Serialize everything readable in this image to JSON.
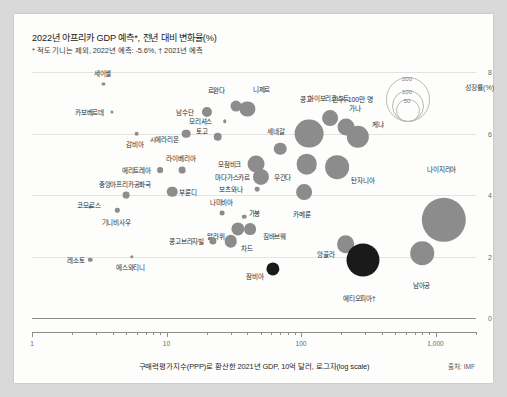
{
  "header": {
    "title": "2022년 아프리카 GDP 예측*, 전년 대비 변화율(%)",
    "subtitle": "* 적도 기니는 제외, 2022년 예측: -5.6%, † 2021년 예측"
  },
  "legend": {
    "name": "인구, 100만 명",
    "sizes": [
      "200",
      "100",
      "50"
    ]
  },
  "footer": {
    "source": "출처: IMF"
  },
  "axes": {
    "y_label": "성장률(%)",
    "y_ticks": [
      "8",
      "6",
      "4",
      "2",
      "0"
    ],
    "x_title": "구매력평가지수(PPP)로 환산한 2021년 GDP, 10억 달러, 로그자(log scale)",
    "x_ticks": [
      "1",
      "10",
      "100",
      "1,000"
    ]
  },
  "chart_data": {
    "type": "scatter",
    "title": "2022년 아프리카 GDP 예측*, 전년 대비 변화율(%)",
    "xlabel": "구매력평가지수(PPP)로 환산한 2021년 GDP, 10억 달러, 로그자(log scale)",
    "ylabel": "성장률(%)",
    "xscale": "log",
    "xlim": [
      1,
      2000
    ],
    "ylim": [
      0,
      8
    ],
    "grid": true,
    "legend_position": "top-right",
    "size_encodes": "인구, 100만 명",
    "points": [
      {
        "label": "세이셸",
        "x": 3.4,
        "y": 7.6,
        "pop": 0.1,
        "color": "#8c8c8c",
        "lx": -1,
        "ly": -10
      },
      {
        "label": "카보베르데",
        "x": 3.9,
        "y": 6.7,
        "pop": 0.6,
        "color": "#8c8c8c",
        "lx": -22,
        "ly": 0
      },
      {
        "label": "남수단",
        "x": 20,
        "y": 6.7,
        "pop": 11,
        "color": "#8c8c8c",
        "lx": -22,
        "ly": 0
      },
      {
        "label": "르완다",
        "x": 33,
        "y": 6.9,
        "pop": 13,
        "color": "#8c8c8c",
        "lx": -20,
        "ly": -10
      },
      {
        "label": "니제르",
        "x": 40,
        "y": 6.8,
        "pop": 25,
        "color": "#8c8c8c",
        "lx": 14,
        "ly": -12
      },
      {
        "label": "모리셔스",
        "x": 27,
        "y": 6.4,
        "pop": 1.3,
        "color": "#8c8c8c",
        "lx": -24,
        "ly": 0
      },
      {
        "label": "아이보리코스트",
        "x": 165,
        "y": 6.5,
        "pop": 27,
        "color": "#8c8c8c",
        "lx": -2,
        "ly": -12
      },
      {
        "label": "가나",
        "x": 215,
        "y": 6.2,
        "pop": 31,
        "color": "#8c8c8c",
        "lx": 9,
        "ly": -11
      },
      {
        "label": "감비아",
        "x": 6.0,
        "y": 6.0,
        "pop": 2.4,
        "color": "#8c8c8c",
        "lx": -2,
        "ly": 8
      },
      {
        "label": "시에라리온",
        "x": 14,
        "y": 6.0,
        "pop": 8,
        "color": "#8c8c8c",
        "lx": -22,
        "ly": 1
      },
      {
        "label": "토고",
        "x": 24,
        "y": 5.9,
        "pop": 8,
        "color": "#8c8c8c",
        "lx": -16,
        "ly": -1
      },
      {
        "label": "콩고",
        "x": 115,
        "y": 6.0,
        "pop": 90,
        "color": "#8c8c8c",
        "lx": -3,
        "ly": -20
      },
      {
        "label": "케냐",
        "x": 265,
        "y": 5.9,
        "pop": 54,
        "color": "#8c8c8c",
        "lx": 20,
        "ly": -1
      },
      {
        "label": "에리트레아",
        "x": 9.0,
        "y": 4.8,
        "pop": 3.6,
        "color": "#8c8c8c",
        "lx": -24,
        "ly": 0
      },
      {
        "label": "라이베리아",
        "x": 13,
        "y": 4.8,
        "pop": 5,
        "color": "#8c8c8c",
        "lx": -1,
        "ly": -9
      },
      {
        "label": "모잠비크",
        "x": 46,
        "y": 5.0,
        "pop": 31,
        "color": "#8c8c8c",
        "lx": -26,
        "ly": 0
      },
      {
        "label": "마다가스카르",
        "x": 50,
        "y": 4.6,
        "pop": 28,
        "color": "#8c8c8c",
        "lx": -28,
        "ly": 0
      },
      {
        "label": "세네갈",
        "x": 70,
        "y": 5.5,
        "pop": 17,
        "color": "#8c8c8c",
        "lx": -4,
        "ly": -12
      },
      {
        "label": "우간다",
        "x": 110,
        "y": 5.0,
        "pop": 46,
        "color": "#8c8c8c",
        "lx": -24,
        "ly": 2
      },
      {
        "label": "탄자니아",
        "x": 185,
        "y": 4.9,
        "pop": 61,
        "color": "#8c8c8c",
        "lx": 26,
        "ly": 1
      },
      {
        "label": "보츠와나",
        "x": 47,
        "y": 4.2,
        "pop": 2.4,
        "color": "#8c8c8c",
        "lx": -26,
        "ly": 0
      },
      {
        "label": "부룬디",
        "x": 11,
        "y": 4.1,
        "pop": 12,
        "color": "#8c8c8c",
        "lx": 16,
        "ly": 0
      },
      {
        "label": "중앙아프리카공화국",
        "x": 5.0,
        "y": 4.0,
        "pop": 5,
        "color": "#8c8c8c",
        "lx": -1,
        "ly": -8
      },
      {
        "label": "카메룬",
        "x": 105,
        "y": 4.1,
        "pop": 27,
        "color": "#8c8c8c",
        "lx": -2,
        "ly": 14
      },
      {
        "label": "코모로스",
        "x": 2.7,
        "y": 3.6,
        "pop": 0.9,
        "color": "#8c8c8c",
        "lx": -1,
        "ly": -1
      },
      {
        "label": "기니비사우",
        "x": 4.3,
        "y": 3.5,
        "pop": 2.0,
        "color": "#8c8c8c",
        "lx": -1,
        "ly": 9
      },
      {
        "label": "나미비아",
        "x": 26,
        "y": 3.4,
        "pop": 2.5,
        "color": "#8c8c8c",
        "lx": -1,
        "ly": -9
      },
      {
        "label": "가봉",
        "x": 38,
        "y": 3.3,
        "pop": 2.2,
        "color": "#8c8c8c",
        "lx": 10,
        "ly": -1
      },
      {
        "label": "나이지리아",
        "x": 1150,
        "y": 3.2,
        "pop": 213,
        "color": "#8c8c8c",
        "lx": -2,
        "ly": -28
      },
      {
        "label": "말라위",
        "x": 34,
        "y": 2.9,
        "pop": 19,
        "color": "#8c8c8c",
        "lx": -22,
        "ly": 1
      },
      {
        "label": "짐바브웨",
        "x": 42,
        "y": 2.9,
        "pop": 15,
        "color": "#8c8c8c",
        "lx": 24,
        "ly": 1
      },
      {
        "label": "콩고브라자빌",
        "x": 22,
        "y": 2.5,
        "pop": 5.7,
        "color": "#8c8c8c",
        "lx": -26,
        "ly": 0
      },
      {
        "label": "차드",
        "x": 30,
        "y": 2.5,
        "pop": 17,
        "color": "#8c8c8c",
        "lx": 16,
        "ly": 1
      },
      {
        "label": "앙골라",
        "x": 215,
        "y": 2.4,
        "pop": 34,
        "color": "#8c8c8c",
        "lx": -20,
        "ly": 1
      },
      {
        "label": "레소토",
        "x": 2.7,
        "y": 1.9,
        "pop": 2.2,
        "color": "#8c8c8c",
        "lx": -14,
        "ly": 0
      },
      {
        "label": "에스와티니",
        "x": 5.5,
        "y": 2.0,
        "pop": 1.2,
        "color": "#8c8c8c",
        "lx": -1,
        "ly": 9
      },
      {
        "label": "잠비아",
        "x": 62,
        "y": 1.6,
        "pop": 19,
        "color": "#1a1a1a",
        "lx": -18,
        "ly": 1
      },
      {
        "label": "에티오피아†",
        "x": 290,
        "y": 1.9,
        "pop": 118,
        "color": "#1a1a1a",
        "lx": -4,
        "ly": 22
      },
      {
        "label": "남아공",
        "x": 800,
        "y": 2.1,
        "pop": 60,
        "color": "#8c8c8c",
        "lx": -1,
        "ly": 20
      }
    ]
  }
}
